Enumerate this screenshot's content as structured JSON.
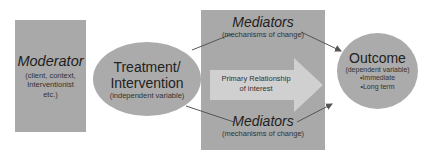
{
  "moderator": {
    "title": "Moderator",
    "subtitle_lines": [
      "(client, context,",
      "Interventionist",
      "etc.)"
    ]
  },
  "treatment": {
    "title_lines": [
      "Treatment/",
      "Intervention"
    ],
    "subtitle": "(independent variable)"
  },
  "mediators_top": {
    "title": "Mediators",
    "subtitle": "(mechanisms of change)"
  },
  "mediators_bottom": {
    "title": "Mediators",
    "subtitle": "(mechanisms of change)"
  },
  "primary_arrow": {
    "label_lines": [
      "Primary Relationship",
      "of interest"
    ]
  },
  "outcome": {
    "title": "Outcome",
    "subtitle": "(dependent variable)",
    "bullets": [
      "•Immediate",
      "•Long term"
    ]
  },
  "colors": {
    "node_fill": "#a9a9a9",
    "arrow_fill": "#d0d0d0",
    "connector": "#555555",
    "text": "#222222"
  }
}
